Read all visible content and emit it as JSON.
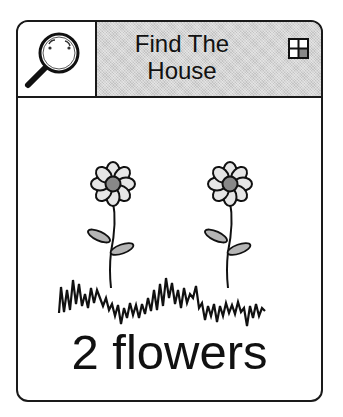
{
  "card": {
    "header": {
      "icon": "magnifying-glass-icon",
      "title_line1": "Find The",
      "title_line2": "House",
      "corner_icon": "four-square-grid-icon"
    },
    "scene": {
      "flowers": [
        {
          "name": "flower-1",
          "icon": "flower-icon"
        },
        {
          "name": "flower-2",
          "icon": "flower-icon"
        }
      ],
      "ground": "grass-icon"
    },
    "caption": "2 flowers"
  },
  "colors": {
    "border": "#1a1a1a",
    "header_fill": "#d4d4d4",
    "petal_fill": "#e6e6e6",
    "center_fill": "#888888",
    "leaf_fill": "#b5b5b5"
  }
}
